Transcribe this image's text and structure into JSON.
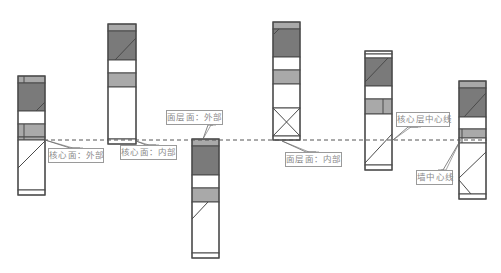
{
  "colors": {
    "outline": "#4a4a4a",
    "core_dark": "#7a7a7a",
    "finish_light": "#a9a9a9",
    "white": "#ffffff",
    "dashed_line": "#555555",
    "leader": "#666666",
    "label_text": "#8a8a8a"
  },
  "reference_line": {
    "y": 140,
    "x1": 44,
    "x2": 487,
    "style": "dashed"
  },
  "walls": [
    {
      "id": "wall-1",
      "x": 18,
      "y": 76,
      "w": 27,
      "h": 119,
      "bands": [
        {
          "y": 76,
          "h": 7,
          "fill": "light"
        },
        {
          "y": 83,
          "h": 28,
          "fill": "dark"
        },
        {
          "y": 111,
          "h": 13,
          "fill": "white"
        },
        {
          "y": 124,
          "h": 13,
          "fill": "light"
        },
        {
          "y": 137,
          "h": 3,
          "fill": "light"
        },
        {
          "y": 140,
          "h": 50,
          "fill": "white"
        },
        {
          "y": 190,
          "h": 5,
          "fill": "white"
        }
      ],
      "lines": [
        {
          "x1": 24,
          "y1": 76,
          "x2": 24,
          "y2": 83
        },
        {
          "x1": 24,
          "y1": 124,
          "x2": 24,
          "y2": 140
        },
        {
          "x1": 45,
          "y1": 102,
          "x2": 36,
          "y2": 111
        },
        {
          "x1": 45,
          "y1": 141,
          "x2": 18,
          "y2": 168
        }
      ]
    },
    {
      "id": "wall-2",
      "x": 108,
      "y": 24,
      "w": 28,
      "h": 120,
      "bands": [
        {
          "y": 24,
          "h": 7,
          "fill": "light"
        },
        {
          "y": 31,
          "h": 29,
          "fill": "dark"
        },
        {
          "y": 60,
          "h": 13,
          "fill": "white"
        },
        {
          "y": 73,
          "h": 14,
          "fill": "light"
        },
        {
          "y": 87,
          "h": 52,
          "fill": "white"
        },
        {
          "y": 139,
          "h": 5,
          "fill": "white"
        }
      ],
      "lines": [
        {
          "x1": 136,
          "y1": 38,
          "x2": 115,
          "y2": 60
        }
      ]
    },
    {
      "id": "wall-3",
      "x": 192,
      "y": 139,
      "w": 27,
      "h": 119,
      "bands": [
        {
          "y": 139,
          "h": 7,
          "fill": "light"
        },
        {
          "y": 146,
          "h": 29,
          "fill": "dark"
        },
        {
          "y": 175,
          "h": 13,
          "fill": "white"
        },
        {
          "y": 188,
          "h": 14,
          "fill": "light"
        },
        {
          "y": 202,
          "h": 51,
          "fill": "white"
        },
        {
          "y": 253,
          "h": 5,
          "fill": "white"
        }
      ],
      "lines": [
        {
          "x1": 208,
          "y1": 202,
          "x2": 192,
          "y2": 219
        }
      ]
    },
    {
      "id": "wall-4",
      "x": 273,
      "y": 22,
      "w": 27,
      "h": 118,
      "bands": [
        {
          "y": 22,
          "h": 7,
          "fill": "light"
        },
        {
          "y": 29,
          "h": 28,
          "fill": "dark"
        },
        {
          "y": 57,
          "h": 13,
          "fill": "white"
        },
        {
          "y": 70,
          "h": 14,
          "fill": "light"
        },
        {
          "y": 84,
          "h": 24,
          "fill": "white"
        },
        {
          "y": 108,
          "h": 28,
          "fill": "white"
        },
        {
          "y": 136,
          "h": 4,
          "fill": "white"
        }
      ],
      "lines": [
        {
          "x1": 279,
          "y1": 29,
          "x2": 274,
          "y2": 34
        },
        {
          "x1": 273,
          "y1": 108,
          "x2": 300,
          "y2": 136
        },
        {
          "x1": 300,
          "y1": 108,
          "x2": 273,
          "y2": 136
        }
      ]
    },
    {
      "id": "wall-5",
      "x": 365,
      "y": 51,
      "w": 27,
      "h": 119,
      "bands": [
        {
          "y": 51,
          "h": 3,
          "fill": "white"
        },
        {
          "y": 54,
          "h": 4,
          "fill": "white"
        },
        {
          "y": 58,
          "h": 28,
          "fill": "dark"
        },
        {
          "y": 86,
          "h": 13,
          "fill": "white"
        },
        {
          "y": 99,
          "h": 15,
          "fill": "light"
        },
        {
          "y": 114,
          "h": 51,
          "fill": "white"
        },
        {
          "y": 165,
          "h": 5,
          "fill": "white"
        }
      ],
      "lines": [
        {
          "x1": 388,
          "y1": 58,
          "x2": 365,
          "y2": 82
        },
        {
          "x1": 383,
          "y1": 99,
          "x2": 383,
          "y2": 114
        },
        {
          "x1": 392,
          "y1": 134,
          "x2": 365,
          "y2": 163
        }
      ]
    },
    {
      "id": "wall-6",
      "x": 459,
      "y": 81,
      "w": 27,
      "h": 118,
      "bands": [
        {
          "y": 81,
          "h": 7,
          "fill": "light"
        },
        {
          "y": 88,
          "h": 29,
          "fill": "dark"
        },
        {
          "y": 117,
          "h": 12,
          "fill": "white"
        },
        {
          "y": 129,
          "h": 9,
          "fill": "light"
        },
        {
          "y": 138,
          "h": 5,
          "fill": "white"
        },
        {
          "y": 143,
          "h": 51,
          "fill": "white"
        },
        {
          "y": 194,
          "h": 5,
          "fill": "white"
        }
      ],
      "lines": [
        {
          "x1": 486,
          "y1": 93,
          "x2": 464,
          "y2": 117
        },
        {
          "x1": 462,
          "y1": 129,
          "x2": 462,
          "y2": 143
        },
        {
          "x1": 486,
          "y1": 152,
          "x2": 459,
          "y2": 178
        },
        {
          "x1": 459,
          "y1": 180,
          "x2": 471,
          "y2": 194
        }
      ]
    }
  ],
  "labels": [
    {
      "id": "core-face-exterior",
      "text": "核心面：外部",
      "box": {
        "x": 48,
        "y": 148,
        "w": 56,
        "h": 15
      },
      "leader": [
        [
          45,
          140
        ],
        [
          70,
          148
        ],
        [
          80,
          148
        ]
      ]
    },
    {
      "id": "core-face-interior",
      "text": "核心面：内部",
      "box": {
        "x": 120,
        "y": 145,
        "w": 57,
        "h": 15
      },
      "leader": [
        [
          136,
          141
        ],
        [
          146,
          145
        ],
        [
          156,
          145
        ]
      ]
    },
    {
      "id": "finish-face-exterior",
      "text": "面层面：外部",
      "box": {
        "x": 166,
        "y": 110,
        "w": 57,
        "h": 15
      },
      "leader": [
        [
          203,
          139
        ],
        [
          208,
          125
        ],
        [
          213,
          125
        ]
      ]
    },
    {
      "id": "finish-face-interior",
      "text": "面层面：内部",
      "box": {
        "x": 285,
        "y": 152,
        "w": 57,
        "h": 15
      },
      "leader": [
        [
          282,
          141
        ],
        [
          306,
          152
        ],
        [
          316,
          152
        ]
      ]
    },
    {
      "id": "core-centerline",
      "text": "核心层中心线",
      "box": {
        "x": 396,
        "y": 112,
        "w": 54,
        "h": 15
      },
      "leader": [
        [
          393,
          140
        ],
        [
          408,
          127
        ],
        [
          418,
          127
        ]
      ]
    },
    {
      "id": "wall-centerline",
      "text": "墙中心线",
      "box": {
        "x": 416,
        "y": 170,
        "w": 37,
        "h": 15
      },
      "leader": [
        [
          460,
          141
        ],
        [
          443,
          170
        ],
        [
          438,
          170
        ]
      ]
    }
  ]
}
